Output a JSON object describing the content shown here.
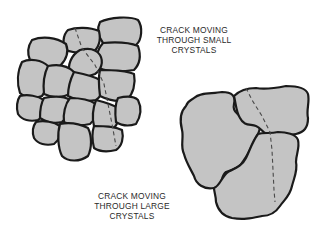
{
  "diagram": {
    "colors": {
      "background": "#ffffff",
      "grain_fill": "#c4c4c4",
      "grain_outline": "#1a1a1a",
      "crack_line": "#4a4a4a",
      "text": "#2a2a2a"
    },
    "labels": {
      "small_crystals": {
        "line1": "CRACK MOVING",
        "line2": "THROUGH SMALL",
        "line3": "CRYSTALS"
      },
      "large_crystals": {
        "line1": "CRACK MOVING",
        "line2": "THROUGH LARGE",
        "line3": "CRYSTALS"
      }
    },
    "figures": [
      {
        "name": "small-crystal-cluster",
        "grain_count": 17,
        "crack_style": "dashed"
      },
      {
        "name": "large-crystal-cluster",
        "grain_count": 3,
        "crack_style": "dashed"
      }
    ]
  }
}
